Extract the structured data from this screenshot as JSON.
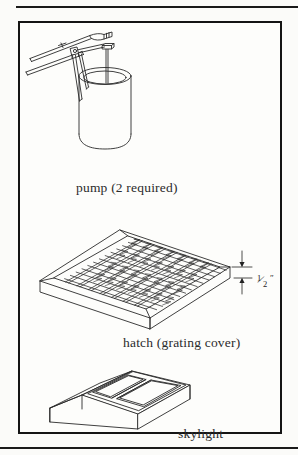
{
  "page": {
    "background_color": "#fbfbf9",
    "ink_color": "#1a1a1a",
    "frame_border_color": "#141414"
  },
  "figure": {
    "type": "technical-illustration",
    "items": [
      {
        "id": "pump",
        "caption": "pump (2 required)",
        "drawing": "hand lever pump mounted on cylindrical well casing"
      },
      {
        "id": "hatch",
        "caption": "hatch (grating cover)",
        "drawing": "square steel bar grating panel in isometric view with beveled frame",
        "dimension": {
          "value_numerator": "1",
          "value_denominator": "2",
          "unit_mark": "″",
          "label": "1/2″",
          "measures": "grating panel thickness"
        }
      },
      {
        "id": "skylight",
        "caption": "skylight",
        "drawing": "sloped skylight curb with two glazing panels"
      }
    ]
  },
  "captions": {
    "pump": "pump (2 required)",
    "hatch": "hatch (grating cover)",
    "skylight": "skylight"
  },
  "dimension": {
    "numerator": "1",
    "denominator": "2",
    "slash": "⁄",
    "inch_mark": "″"
  }
}
